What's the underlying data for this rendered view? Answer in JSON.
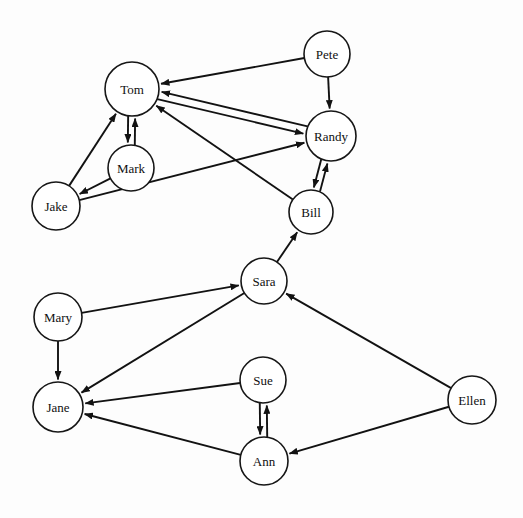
{
  "figure": {
    "title": "",
    "background_color": "#fdfdfd",
    "node_fill": "#ffffff",
    "node_stroke": "#161616",
    "edge_color": "#121212",
    "width": 523,
    "height": 518
  },
  "chart_data": {
    "type": "diagram",
    "diagram_type": "directed-graph",
    "title": "",
    "xlabel": "",
    "ylabel": "",
    "grid": false,
    "legend": null,
    "xlim": [
      0,
      523
    ],
    "ylim": [
      0,
      518
    ],
    "nodes": [
      {
        "id": "Pete",
        "label": "Pete",
        "x": 327,
        "y": 54,
        "r": 23
      },
      {
        "id": "Tom",
        "label": "Tom",
        "x": 132,
        "y": 89,
        "r": 27
      },
      {
        "id": "Randy",
        "label": "Randy",
        "x": 331,
        "y": 136,
        "r": 25
      },
      {
        "id": "Mark",
        "label": "Mark",
        "x": 131,
        "y": 168,
        "r": 23
      },
      {
        "id": "Jake",
        "label": "Jake",
        "x": 56,
        "y": 206,
        "r": 24
      },
      {
        "id": "Bill",
        "label": "Bill",
        "x": 311,
        "y": 212,
        "r": 22
      },
      {
        "id": "Sara",
        "label": "Sara",
        "x": 264,
        "y": 281,
        "r": 23
      },
      {
        "id": "Mary",
        "label": "Mary",
        "x": 58,
        "y": 317,
        "r": 24
      },
      {
        "id": "Sue",
        "label": "Sue",
        "x": 263,
        "y": 380,
        "r": 23
      },
      {
        "id": "Ellen",
        "label": "Ellen",
        "x": 472,
        "y": 400,
        "r": 24
      },
      {
        "id": "Jane",
        "label": "Jane",
        "x": 58,
        "y": 407,
        "r": 25
      },
      {
        "id": "Ann",
        "label": "Ann",
        "x": 264,
        "y": 461,
        "r": 24
      }
    ],
    "edges": [
      {
        "from": "Pete",
        "to": "Tom",
        "directed": true,
        "offset": 0
      },
      {
        "from": "Pete",
        "to": "Randy",
        "directed": true,
        "offset": 0
      },
      {
        "from": "Tom",
        "to": "Randy",
        "directed": true,
        "offset": 4
      },
      {
        "from": "Randy",
        "to": "Tom",
        "directed": true,
        "offset": 4
      },
      {
        "from": "Tom",
        "to": "Mark",
        "directed": true,
        "offset": 3.5
      },
      {
        "from": "Mark",
        "to": "Tom",
        "directed": true,
        "offset": 3.5
      },
      {
        "from": "Mark",
        "to": "Jake",
        "directed": true,
        "offset": 0
      },
      {
        "from": "Jake",
        "to": "Tom",
        "directed": true,
        "offset": 0
      },
      {
        "from": "Jake",
        "to": "Randy",
        "directed": true,
        "offset": 0
      },
      {
        "from": "Bill",
        "to": "Tom",
        "directed": true,
        "offset": 0
      },
      {
        "from": "Bill",
        "to": "Randy",
        "directed": true,
        "offset": 3.5
      },
      {
        "from": "Randy",
        "to": "Bill",
        "directed": true,
        "offset": 3.5
      },
      {
        "from": "Sara",
        "to": "Bill",
        "directed": true,
        "offset": 0
      },
      {
        "from": "Mary",
        "to": "Sara",
        "directed": true,
        "offset": 0
      },
      {
        "from": "Mary",
        "to": "Jane",
        "directed": true,
        "offset": 0
      },
      {
        "from": "Sara",
        "to": "Jane",
        "directed": true,
        "offset": 0
      },
      {
        "from": "Ellen",
        "to": "Sara",
        "directed": true,
        "offset": 0
      },
      {
        "from": "Ellen",
        "to": "Ann",
        "directed": true,
        "offset": 0
      },
      {
        "from": "Sue",
        "to": "Jane",
        "directed": true,
        "offset": 0
      },
      {
        "from": "Sue",
        "to": "Ann",
        "directed": true,
        "offset": 3.5
      },
      {
        "from": "Ann",
        "to": "Sue",
        "directed": true,
        "offset": 3.5
      },
      {
        "from": "Ann",
        "to": "Jane",
        "directed": true,
        "offset": 0
      }
    ]
  }
}
